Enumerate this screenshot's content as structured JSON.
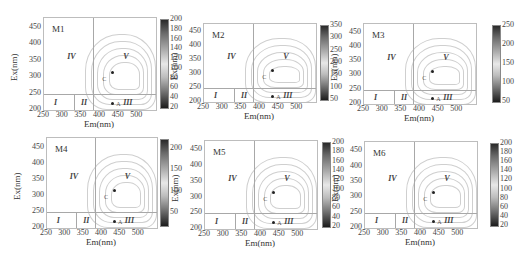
{
  "chart_data": [
    {
      "type": "heatmap",
      "title": "M1",
      "xlabel": "Em(nm)",
      "ylabel": "Ex(nm)",
      "xlim": [
        250,
        550
      ],
      "ylim": [
        200,
        480
      ],
      "xticks": [
        "250",
        "300",
        "350",
        "400",
        "450",
        "500"
      ],
      "yticks": [
        "200",
        "250",
        "300",
        "350",
        "400",
        "450"
      ],
      "colorbar": {
        "min": 20,
        "max": 200,
        "ticks": [
          "200",
          "180",
          "160",
          "140",
          "120",
          "100",
          "80",
          "60",
          "40",
          "20"
        ]
      },
      "regions": [
        "I",
        "II",
        "III",
        "IV",
        "V"
      ],
      "peaks": [
        {
          "label": "C",
          "em": 430,
          "ex": 320
        },
        {
          "label": "A",
          "em": 430,
          "ex": 225
        }
      ],
      "region_boundaries": {
        "ex": 250,
        "em": [
          330,
          380
        ]
      }
    },
    {
      "type": "heatmap",
      "title": "M2",
      "xlabel": "Em(nm)",
      "ylabel": "Ex(nm)",
      "xlim": [
        250,
        550
      ],
      "ylim": [
        200,
        480
      ],
      "xticks": [
        "250",
        "300",
        "350",
        "400",
        "450",
        "500"
      ],
      "yticks": [
        "200",
        "250",
        "300",
        "350",
        "400",
        "450"
      ],
      "colorbar": {
        "min": 50,
        "max": 350,
        "ticks": [
          "350",
          "300",
          "250",
          "200",
          "150",
          "100",
          "50"
        ]
      },
      "regions": [
        "I",
        "II",
        "III",
        "IV",
        "V"
      ],
      "peaks": [
        {
          "label": "C",
          "em": 430,
          "ex": 320
        },
        {
          "label": "A",
          "em": 430,
          "ex": 225
        }
      ],
      "region_boundaries": {
        "ex": 250,
        "em": [
          330,
          380
        ]
      }
    },
    {
      "type": "heatmap",
      "title": "M3",
      "xlabel": "Em(nm)",
      "ylabel": "Ex(nm)",
      "xlim": [
        250,
        550
      ],
      "ylim": [
        200,
        480
      ],
      "xticks": [
        "250",
        "300",
        "350",
        "400",
        "450",
        "500"
      ],
      "yticks": [
        "200",
        "250",
        "300",
        "350",
        "400",
        "450"
      ],
      "colorbar": {
        "min": 50,
        "max": 250,
        "ticks": [
          "250",
          "200",
          "150",
          "100",
          "50"
        ]
      },
      "regions": [
        "I",
        "II",
        "III",
        "IV",
        "V"
      ],
      "peaks": [
        {
          "label": "C",
          "em": 430,
          "ex": 320
        },
        {
          "label": "A",
          "em": 430,
          "ex": 225
        }
      ],
      "region_boundaries": {
        "ex": 250,
        "em": [
          330,
          380
        ]
      }
    },
    {
      "type": "heatmap",
      "title": "M4",
      "xlabel": "Em(nm)",
      "ylabel": "Ex(nm)",
      "xlim": [
        250,
        550
      ],
      "ylim": [
        200,
        480
      ],
      "xticks": [
        "250",
        "300",
        "350",
        "400",
        "450",
        "500"
      ],
      "yticks": [
        "200",
        "250",
        "300",
        "350",
        "400",
        "450"
      ],
      "colorbar": {
        "min": 20,
        "max": 220,
        "ticks": [
          "200",
          "150",
          "100",
          "50"
        ]
      },
      "regions": [
        "I",
        "II",
        "III",
        "IV",
        "V"
      ],
      "peaks": [
        {
          "label": "C",
          "em": 430,
          "ex": 320
        },
        {
          "label": "A",
          "em": 430,
          "ex": 225
        }
      ],
      "region_boundaries": {
        "ex": 250,
        "em": [
          330,
          380
        ]
      }
    },
    {
      "type": "heatmap",
      "title": "M5",
      "xlabel": "Em(nm)",
      "ylabel": "Ex(nm)",
      "xlim": [
        250,
        550
      ],
      "ylim": [
        200,
        480
      ],
      "xticks": [
        "250",
        "300",
        "350",
        "400",
        "450",
        "500"
      ],
      "yticks": [
        "200",
        "250",
        "300",
        "350",
        "400",
        "450"
      ],
      "colorbar": {
        "min": 20,
        "max": 200,
        "ticks": [
          "200",
          "180",
          "160",
          "140",
          "120",
          "100",
          "80",
          "60",
          "40",
          "20"
        ]
      },
      "regions": [
        "I",
        "II",
        "III",
        "IV",
        "V"
      ],
      "peaks": [
        {
          "label": "C",
          "em": 430,
          "ex": 320
        },
        {
          "label": "A",
          "em": 430,
          "ex": 225
        }
      ],
      "region_boundaries": {
        "ex": 250,
        "em": [
          330,
          380
        ]
      }
    },
    {
      "type": "heatmap",
      "title": "M6",
      "xlabel": "Em(nm)",
      "ylabel": "Ex(nm)",
      "xlim": [
        250,
        550
      ],
      "ylim": [
        200,
        480
      ],
      "xticks": [
        "250",
        "300",
        "350",
        "400",
        "450",
        "500"
      ],
      "yticks": [
        "200",
        "250",
        "300",
        "350",
        "400",
        "450"
      ],
      "colorbar": {
        "min": 20,
        "max": 200,
        "ticks": [
          "200",
          "180",
          "160",
          "140",
          "120",
          "100",
          "80",
          "60",
          "40",
          "20"
        ]
      },
      "regions": [
        "I",
        "II",
        "III",
        "IV",
        "V"
      ],
      "peaks": [
        {
          "label": "C",
          "em": 430,
          "ex": 320
        },
        {
          "label": "A",
          "em": 430,
          "ex": 225
        }
      ],
      "region_boundaries": {
        "ex": 250,
        "em": [
          330,
          380
        ]
      }
    }
  ]
}
